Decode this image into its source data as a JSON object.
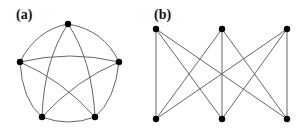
{
  "panels": [
    {
      "id": "a",
      "label": "(a)",
      "graph": "K5",
      "label_pos": [
        16,
        19
      ],
      "nodes": [
        {
          "id": "top",
          "x": 68,
          "y": 24
        },
        {
          "id": "left",
          "x": 20,
          "y": 62
        },
        {
          "id": "right",
          "x": 119,
          "y": 62
        },
        {
          "id": "bottom-left",
          "x": 42,
          "y": 117
        },
        {
          "id": "bottom-right",
          "x": 95,
          "y": 117
        }
      ],
      "edges": [
        {
          "d": "M68,24 Q36,30 20,62"
        },
        {
          "d": "M68,24 Q104,30 119,62"
        },
        {
          "d": "M20,62 Q22,100 42,117"
        },
        {
          "d": "M119,62 Q115,100 95,117"
        },
        {
          "d": "M42,117 Q68,127 95,117"
        },
        {
          "d": "M68,24 Q44,60 42,117"
        },
        {
          "d": "M68,24 Q92,60 95,117"
        },
        {
          "d": "M20,62 Q70,50 119,62"
        },
        {
          "d": "M20,62 Q62,80 95,117"
        },
        {
          "d": "M119,62 Q76,80 42,117"
        }
      ]
    },
    {
      "id": "b",
      "label": "(b)",
      "graph": "K3,3",
      "label_pos": [
        154,
        19
      ],
      "nodes": [
        {
          "id": "t1",
          "x": 156,
          "y": 29
        },
        {
          "id": "t2",
          "x": 222,
          "y": 29
        },
        {
          "id": "t3",
          "x": 287,
          "y": 29
        },
        {
          "id": "b1",
          "x": 156,
          "y": 119
        },
        {
          "id": "b2",
          "x": 222,
          "y": 119
        },
        {
          "id": "b3",
          "x": 287,
          "y": 119
        }
      ],
      "edges": [
        {
          "d": "M156,29 L156,119"
        },
        {
          "d": "M156,29 L222,119"
        },
        {
          "d": "M156,29 L287,119"
        },
        {
          "d": "M222,29 L156,119"
        },
        {
          "d": "M222,29 L222,119"
        },
        {
          "d": "M222,29 L287,119"
        },
        {
          "d": "M287,29 L156,119"
        },
        {
          "d": "M287,29 L222,119"
        },
        {
          "d": "M287,29 L287,119"
        }
      ]
    }
  ],
  "style": {
    "node_color": "#000000",
    "edge_color": "#555555",
    "node_radius": 3.2
  }
}
